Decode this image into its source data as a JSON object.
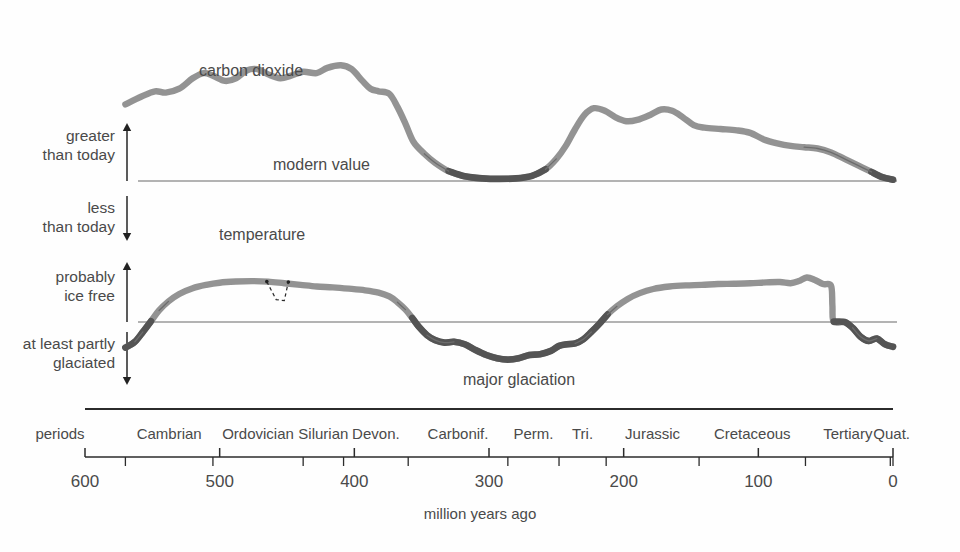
{
  "figure": {
    "caption": "million years ago",
    "periods_row_label": "periods"
  },
  "curve_labels": {
    "co2": "carbon dioxide",
    "modern_value": "modern value",
    "temperature": "temperature",
    "major_glaciation": "major glaciation"
  },
  "axis_labels": {
    "greater_than_today": [
      "greater",
      "than today"
    ],
    "less_than_today": [
      "less",
      "than today"
    ],
    "probably_ice_free": [
      "probably",
      "ice free"
    ],
    "at_least_partly_glaciated": [
      "at least partly",
      "glaciated"
    ]
  },
  "colors": {
    "curve": "#8d8d8d",
    "curve_dark": "#545454",
    "baseline": "#9a9a9a",
    "axis": "#2b2b2b",
    "text": "#4a4a4a"
  },
  "chart_data": {
    "type": "line",
    "title": "",
    "subtitle": "",
    "xlabel": "million years ago",
    "ylabel": "",
    "xlim": [
      600,
      0
    ],
    "x_reversed": true,
    "grid": false,
    "legend": "none",
    "x_ticks": [
      600,
      500,
      400,
      300,
      200,
      100,
      0
    ],
    "x_tick_labels": [
      "600",
      "500",
      "400",
      "300",
      "200",
      "100",
      "0"
    ],
    "periods": [
      {
        "label": "Cambrian",
        "start": 570,
        "end": 505
      },
      {
        "label": "Ordovician",
        "start": 505,
        "end": 438
      },
      {
        "label": "Silurian",
        "start": 438,
        "end": 408
      },
      {
        "label": "Devon.",
        "start": 408,
        "end": 360
      },
      {
        "label": "Carbonif.",
        "start": 360,
        "end": 286
      },
      {
        "label": "Perm.",
        "start": 286,
        "end": 248
      },
      {
        "label": "Tri.",
        "start": 248,
        "end": 213
      },
      {
        "label": "Jurassic",
        "start": 213,
        "end": 144
      },
      {
        "label": "Cretaceous",
        "start": 144,
        "end": 65
      },
      {
        "label": "Tertiary",
        "start": 65,
        "end": 2
      },
      {
        "label": "Quat.",
        "start": 2,
        "end": 0
      }
    ],
    "period_boundaries": [
      570,
      505,
      438,
      408,
      360,
      286,
      248,
      213,
      144,
      65,
      2,
      0
    ],
    "series": [
      {
        "name": "carbon dioxide",
        "panel": "co2",
        "reference_line_label": "modern value",
        "reference_line_value": 0,
        "units": "relative to modern value",
        "points": [
          {
            "x": 570,
            "y": 2.95
          },
          {
            "x": 558,
            "y": 3.25
          },
          {
            "x": 548,
            "y": 3.45
          },
          {
            "x": 540,
            "y": 3.4
          },
          {
            "x": 530,
            "y": 3.55
          },
          {
            "x": 520,
            "y": 3.95
          },
          {
            "x": 512,
            "y": 4.15
          },
          {
            "x": 505,
            "y": 4.05
          },
          {
            "x": 496,
            "y": 3.85
          },
          {
            "x": 488,
            "y": 3.95
          },
          {
            "x": 480,
            "y": 4.25
          },
          {
            "x": 472,
            "y": 4.3
          },
          {
            "x": 464,
            "y": 4.1
          },
          {
            "x": 455,
            "y": 3.95
          },
          {
            "x": 447,
            "y": 4.05
          },
          {
            "x": 438,
            "y": 4.2
          },
          {
            "x": 428,
            "y": 4.15
          },
          {
            "x": 420,
            "y": 4.35
          },
          {
            "x": 410,
            "y": 4.45
          },
          {
            "x": 402,
            "y": 4.3
          },
          {
            "x": 394,
            "y": 3.85
          },
          {
            "x": 388,
            "y": 3.55
          },
          {
            "x": 382,
            "y": 3.45
          },
          {
            "x": 374,
            "y": 3.35
          },
          {
            "x": 368,
            "y": 2.85
          },
          {
            "x": 362,
            "y": 2.2
          },
          {
            "x": 356,
            "y": 1.5
          },
          {
            "x": 348,
            "y": 1.05
          },
          {
            "x": 340,
            "y": 0.7
          },
          {
            "x": 330,
            "y": 0.38
          },
          {
            "x": 318,
            "y": 0.18
          },
          {
            "x": 305,
            "y": 0.1
          },
          {
            "x": 292,
            "y": 0.08
          },
          {
            "x": 280,
            "y": 0.1
          },
          {
            "x": 268,
            "y": 0.2
          },
          {
            "x": 258,
            "y": 0.45
          },
          {
            "x": 250,
            "y": 0.85
          },
          {
            "x": 243,
            "y": 1.35
          },
          {
            "x": 236,
            "y": 2.0
          },
          {
            "x": 229,
            "y": 2.55
          },
          {
            "x": 222,
            "y": 2.8
          },
          {
            "x": 214,
            "y": 2.7
          },
          {
            "x": 206,
            "y": 2.45
          },
          {
            "x": 198,
            "y": 2.3
          },
          {
            "x": 190,
            "y": 2.35
          },
          {
            "x": 180,
            "y": 2.55
          },
          {
            "x": 172,
            "y": 2.75
          },
          {
            "x": 164,
            "y": 2.7
          },
          {
            "x": 156,
            "y": 2.45
          },
          {
            "x": 148,
            "y": 2.15
          },
          {
            "x": 140,
            "y": 2.05
          },
          {
            "x": 128,
            "y": 2.0
          },
          {
            "x": 116,
            "y": 1.95
          },
          {
            "x": 106,
            "y": 1.85
          },
          {
            "x": 96,
            "y": 1.6
          },
          {
            "x": 86,
            "y": 1.45
          },
          {
            "x": 76,
            "y": 1.35
          },
          {
            "x": 66,
            "y": 1.3
          },
          {
            "x": 56,
            "y": 1.25
          },
          {
            "x": 46,
            "y": 1.1
          },
          {
            "x": 36,
            "y": 0.85
          },
          {
            "x": 26,
            "y": 0.6
          },
          {
            "x": 16,
            "y": 0.35
          },
          {
            "x": 8,
            "y": 0.15
          },
          {
            "x": 0,
            "y": 0.05
          }
        ]
      },
      {
        "name": "temperature",
        "panel": "temperature",
        "reference_line_label": "",
        "reference_line_value": 0,
        "units": "relative (ice-free above line, glaciated below)",
        "points": [
          {
            "x": 570,
            "y": -1.55
          },
          {
            "x": 563,
            "y": -1.2
          },
          {
            "x": 557,
            "y": -0.6
          },
          {
            "x": 551,
            "y": 0.05
          },
          {
            "x": 545,
            "y": 0.7
          },
          {
            "x": 538,
            "y": 1.25
          },
          {
            "x": 530,
            "y": 1.7
          },
          {
            "x": 520,
            "y": 2.05
          },
          {
            "x": 510,
            "y": 2.25
          },
          {
            "x": 500,
            "y": 2.38
          },
          {
            "x": 488,
            "y": 2.45
          },
          {
            "x": 476,
            "y": 2.48
          },
          {
            "x": 464,
            "y": 2.45
          },
          {
            "x": 452,
            "y": 2.35
          },
          {
            "x": 440,
            "y": 2.25
          },
          {
            "x": 428,
            "y": 2.15
          },
          {
            "x": 416,
            "y": 2.1
          },
          {
            "x": 404,
            "y": 2.02
          },
          {
            "x": 392,
            "y": 1.92
          },
          {
            "x": 382,
            "y": 1.78
          },
          {
            "x": 374,
            "y": 1.55
          },
          {
            "x": 368,
            "y": 1.2
          },
          {
            "x": 362,
            "y": 0.75
          },
          {
            "x": 357,
            "y": 0.25
          },
          {
            "x": 352,
            "y": -0.3
          },
          {
            "x": 346,
            "y": -0.8
          },
          {
            "x": 340,
            "y": -1.1
          },
          {
            "x": 333,
            "y": -1.25
          },
          {
            "x": 326,
            "y": -1.2
          },
          {
            "x": 318,
            "y": -1.35
          },
          {
            "x": 310,
            "y": -1.7
          },
          {
            "x": 302,
            "y": -2.0
          },
          {
            "x": 294,
            "y": -2.2
          },
          {
            "x": 286,
            "y": -2.28
          },
          {
            "x": 278,
            "y": -2.2
          },
          {
            "x": 270,
            "y": -2.0
          },
          {
            "x": 262,
            "y": -1.95
          },
          {
            "x": 254,
            "y": -1.75
          },
          {
            "x": 248,
            "y": -1.45
          },
          {
            "x": 242,
            "y": -1.35
          },
          {
            "x": 236,
            "y": -1.3
          },
          {
            "x": 230,
            "y": -1.05
          },
          {
            "x": 224,
            "y": -0.6
          },
          {
            "x": 218,
            "y": -0.1
          },
          {
            "x": 212,
            "y": 0.45
          },
          {
            "x": 205,
            "y": 0.95
          },
          {
            "x": 197,
            "y": 1.4
          },
          {
            "x": 188,
            "y": 1.75
          },
          {
            "x": 178,
            "y": 2.0
          },
          {
            "x": 166,
            "y": 2.15
          },
          {
            "x": 154,
            "y": 2.22
          },
          {
            "x": 142,
            "y": 2.25
          },
          {
            "x": 130,
            "y": 2.3
          },
          {
            "x": 118,
            "y": 2.32
          },
          {
            "x": 106,
            "y": 2.35
          },
          {
            "x": 94,
            "y": 2.4
          },
          {
            "x": 84,
            "y": 2.42
          },
          {
            "x": 76,
            "y": 2.35
          },
          {
            "x": 70,
            "y": 2.48
          },
          {
            "x": 64,
            "y": 2.7
          },
          {
            "x": 58,
            "y": 2.55
          },
          {
            "x": 52,
            "y": 2.3
          },
          {
            "x": 46,
            "y": 2.2
          },
          {
            "x": 45,
            "y": 1.0
          },
          {
            "x": 44,
            "y": 0.02
          },
          {
            "x": 36,
            "y": 0.0
          },
          {
            "x": 30,
            "y": -0.35
          },
          {
            "x": 24,
            "y": -0.9
          },
          {
            "x": 18,
            "y": -1.15
          },
          {
            "x": 12,
            "y": -1.0
          },
          {
            "x": 6,
            "y": -1.35
          },
          {
            "x": 0,
            "y": -1.5
          }
        ],
        "annotation": {
          "label": "",
          "style": "dashed",
          "description": "brief dashed cold excursion notch on the temperature curve",
          "points": [
            {
              "x": 465,
              "y": 2.45
            },
            {
              "x": 458,
              "y": 1.35
            },
            {
              "x": 452,
              "y": 1.3
            },
            {
              "x": 449,
              "y": 2.42
            }
          ]
        }
      }
    ]
  }
}
